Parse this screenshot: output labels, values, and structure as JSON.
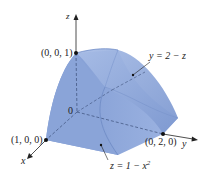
{
  "figure": {
    "axes": {
      "x": "x",
      "y": "y",
      "z": "z"
    },
    "origin_label": "0",
    "points": [
      {
        "label": "(0, 0, 1)"
      },
      {
        "label": "(1, 0, 0)"
      },
      {
        "label": "(0, 2, 0)"
      }
    ],
    "surfaces": [
      {
        "equation": "y = 2 − z"
      },
      {
        "equation_base": "z = 1 − x",
        "exponent": "2"
      }
    ],
    "colors": {
      "solid_fill": "#8fa9d9",
      "solid_dark": "#6f8cc7",
      "solid_light": "#b3c6ea",
      "axis": "#222222"
    }
  }
}
